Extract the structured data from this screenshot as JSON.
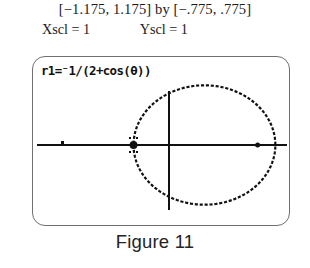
{
  "header": {
    "range_line": "[−1.175, 1.175] by [−.775, .775]",
    "xscl_label": "Xscl = 1",
    "yscl_label": "Yscl = 1"
  },
  "screen": {
    "equation": "r1=⁻1/(2+cos(θ))"
  },
  "caption": {
    "text": "Figure 11"
  },
  "colors": {
    "ink": "#111111",
    "bezel": "#6f6f6f",
    "screen_bg": "#ffffff",
    "caption": "#242424"
  },
  "chart_data": {
    "type": "line",
    "title": "",
    "subtitle": "",
    "xlabel": "",
    "ylabel": "",
    "equation": "r1=⁻1/(2+cos(θ))",
    "coordinate_system": "polar",
    "xlim": [
      -1.175,
      1.175
    ],
    "ylim": [
      -0.775,
      0.775
    ],
    "xscl": 1,
    "yscl": 1,
    "grid": false,
    "legend": "none",
    "axes_shown": [
      "x-axis",
      "y-axis"
    ],
    "xtick_values": [
      -1,
      0,
      1
    ],
    "ytick_values": [
      0
    ],
    "curve_description": "ellipse traced by the polar equation r = -1/(2+cos(theta)); conic with eccentricity 1/2",
    "curve_geometry": {
      "shape": "ellipse",
      "center_x": 0.1667,
      "center_y": 0.0,
      "semi_axis_x": 0.6667,
      "semi_axis_y": 0.5774,
      "vertex_left_x": -0.3333,
      "vertex_right_x": 0.8333,
      "top_y": 0.5774,
      "bottom_y": -0.5774
    },
    "marked_points": [
      {
        "label": "left vertex",
        "x": -0.3333,
        "y": 0.0
      },
      {
        "label": "right vertex",
        "x": 0.8333,
        "y": 0.0
      }
    ],
    "series": [
      {
        "name": "r = -1/(2+cos(theta))",
        "theta_deg": [
          0,
          15,
          30,
          45,
          60,
          75,
          90,
          105,
          120,
          135,
          150,
          165,
          180,
          195,
          210,
          225,
          240,
          255,
          270,
          285,
          300,
          315,
          330,
          345,
          360
        ],
        "r": [
          -0.3333,
          -0.3379,
          -0.3516,
          -0.3754,
          -0.4,
          -0.4188,
          -0.5,
          -0.5775,
          -0.6667,
          -0.7664,
          -0.8685,
          -0.9586,
          -1.0,
          -0.9586,
          -0.8685,
          -0.7664,
          -0.6667,
          -0.5775,
          -0.5,
          -0.4188,
          -0.4,
          -0.3754,
          -0.3516,
          -0.3379,
          -0.3333
        ],
        "x": [
          -0.3333,
          -0.3264,
          -0.3045,
          -0.2655,
          -0.2,
          -0.1084,
          0.0,
          0.1494,
          0.3333,
          0.5419,
          0.7521,
          0.9259,
          1.0,
          0.9259,
          0.7521,
          0.5419,
          0.3333,
          0.1494,
          0.0,
          -0.1084,
          -0.2,
          -0.2655,
          -0.3045,
          -0.3264,
          -0.3333
        ],
        "y": [
          0.0,
          -0.0874,
          -0.1758,
          -0.2655,
          -0.3464,
          -0.4045,
          -0.5,
          -0.5578,
          -0.5774,
          -0.5419,
          -0.4342,
          -0.2481,
          0.0,
          0.2481,
          0.4342,
          0.5419,
          0.5774,
          0.5578,
          0.5,
          0.4045,
          0.3464,
          0.2655,
          0.1758,
          0.0874,
          0.0
        ]
      }
    ]
  }
}
